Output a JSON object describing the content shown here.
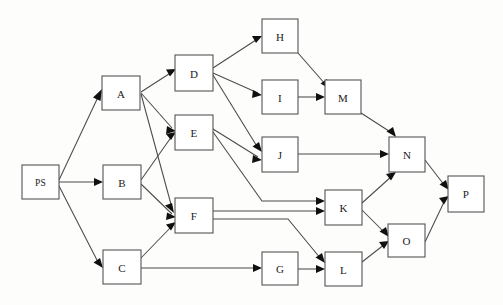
{
  "diagram": {
    "type": "directed-graph",
    "background_color": "#fdfdfc",
    "node_fill": "#ffffff",
    "node_stroke": "#555555",
    "edge_color": "#4a4a4a",
    "nodes": [
      {
        "id": "PS",
        "label": "PS",
        "x": 22,
        "y": 165,
        "w": 37,
        "h": 34
      },
      {
        "id": "A",
        "label": "A",
        "x": 102,
        "y": 76,
        "w": 38,
        "h": 34
      },
      {
        "id": "B",
        "label": "B",
        "x": 103,
        "y": 165,
        "w": 38,
        "h": 34
      },
      {
        "id": "C",
        "label": "C",
        "x": 103,
        "y": 250,
        "w": 38,
        "h": 34
      },
      {
        "id": "D",
        "label": "D",
        "x": 175,
        "y": 55,
        "w": 38,
        "h": 36
      },
      {
        "id": "E",
        "label": "E",
        "x": 175,
        "y": 115,
        "w": 38,
        "h": 35
      },
      {
        "id": "F",
        "label": "F",
        "x": 175,
        "y": 198,
        "w": 38,
        "h": 35
      },
      {
        "id": "G",
        "label": "G",
        "x": 262,
        "y": 252,
        "w": 36,
        "h": 33
      },
      {
        "id": "H",
        "label": "H",
        "x": 262,
        "y": 19,
        "w": 36,
        "h": 34
      },
      {
        "id": "I",
        "label": "I",
        "x": 262,
        "y": 80,
        "w": 36,
        "h": 34
      },
      {
        "id": "J",
        "label": "J",
        "x": 262,
        "y": 137,
        "w": 36,
        "h": 35
      },
      {
        "id": "K",
        "label": "K",
        "x": 325,
        "y": 190,
        "w": 37,
        "h": 35
      },
      {
        "id": "L",
        "label": "L",
        "x": 325,
        "y": 252,
        "w": 37,
        "h": 34
      },
      {
        "id": "M",
        "label": "M",
        "x": 325,
        "y": 80,
        "w": 36,
        "h": 34
      },
      {
        "id": "N",
        "label": "N",
        "x": 389,
        "y": 137,
        "w": 36,
        "h": 35
      },
      {
        "id": "O",
        "label": "O",
        "x": 388,
        "y": 224,
        "w": 37,
        "h": 33
      },
      {
        "id": "P",
        "label": "P",
        "x": 448,
        "y": 176,
        "w": 36,
        "h": 36
      }
    ],
    "edges": [
      {
        "from": "PS",
        "to": "A"
      },
      {
        "from": "PS",
        "to": "B"
      },
      {
        "from": "PS",
        "to": "C"
      },
      {
        "from": "A",
        "to": "D"
      },
      {
        "from": "A",
        "to": "E"
      },
      {
        "from": "A",
        "to": "F"
      },
      {
        "from": "B",
        "to": "E"
      },
      {
        "from": "B",
        "to": "F"
      },
      {
        "from": "C",
        "to": "F"
      },
      {
        "from": "C",
        "to": "G"
      },
      {
        "from": "C",
        "to": "L"
      },
      {
        "from": "D",
        "to": "H"
      },
      {
        "from": "D",
        "to": "I"
      },
      {
        "from": "D",
        "to": "J"
      },
      {
        "from": "E",
        "to": "J"
      },
      {
        "from": "E",
        "to": "K"
      },
      {
        "from": "F",
        "to": "K"
      },
      {
        "from": "F",
        "to": "K2"
      },
      {
        "from": "G",
        "to": "L"
      },
      {
        "from": "H",
        "to": "M"
      },
      {
        "from": "I",
        "to": "M"
      },
      {
        "from": "J",
        "to": "N"
      },
      {
        "from": "K",
        "to": "N"
      },
      {
        "from": "K",
        "to": "O"
      },
      {
        "from": "L",
        "to": "O"
      },
      {
        "from": "M",
        "to": "N"
      },
      {
        "from": "N",
        "to": "P"
      },
      {
        "from": "O",
        "to": "P"
      }
    ]
  }
}
